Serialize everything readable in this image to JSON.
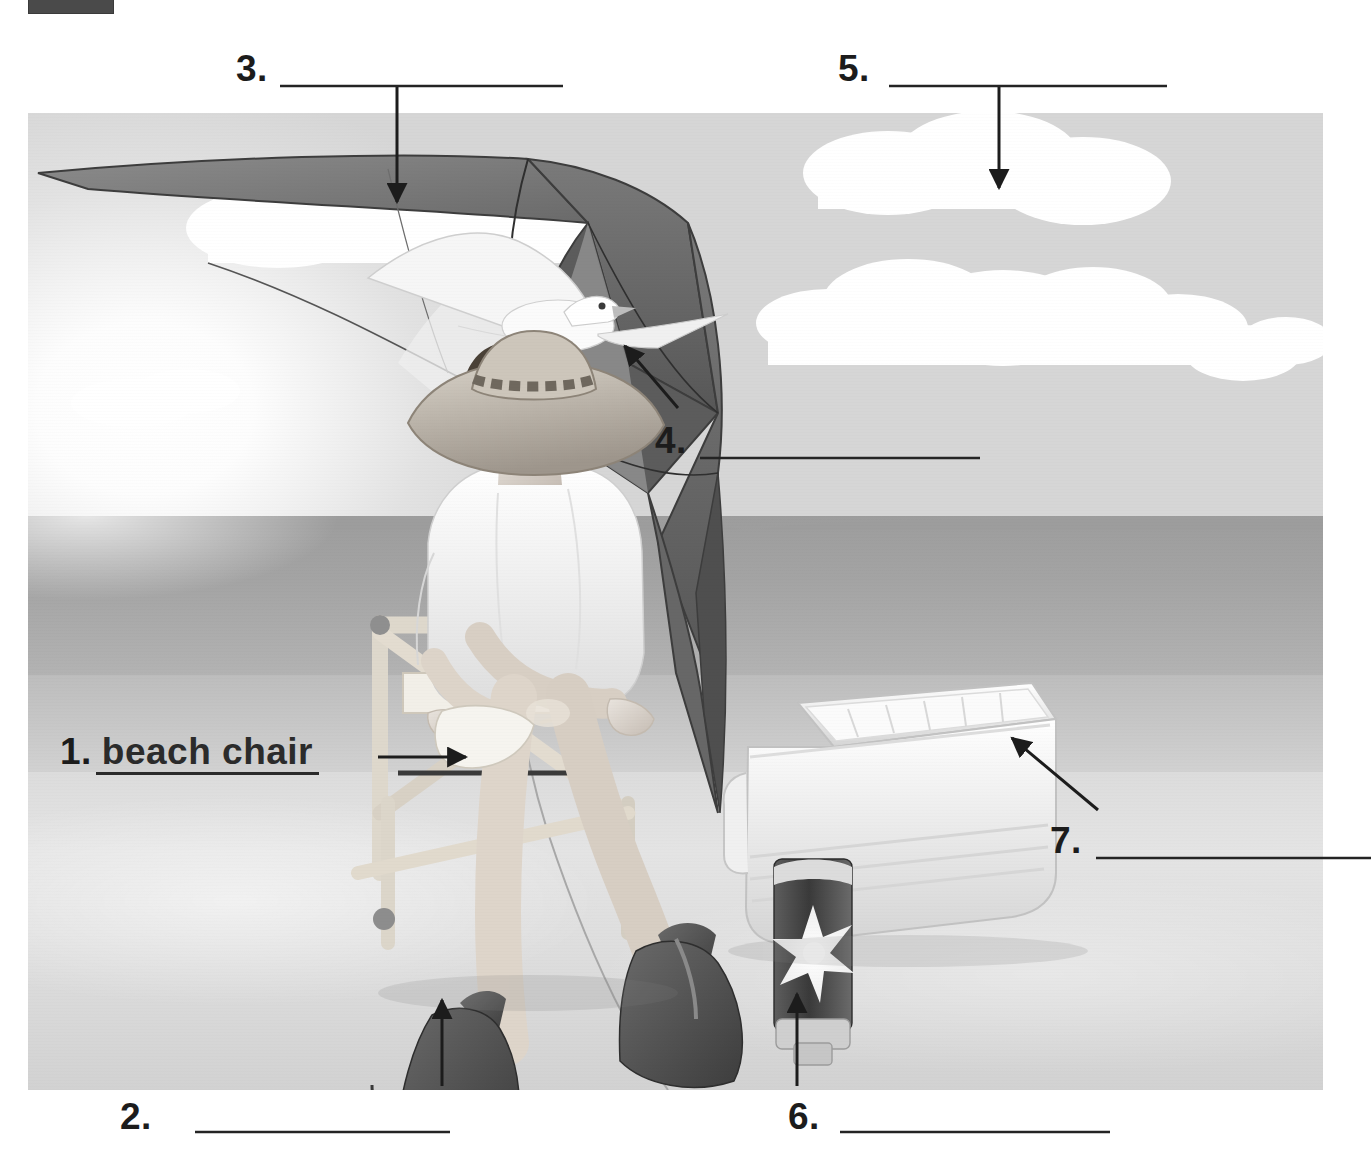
{
  "page": {
    "type": "vocabulary-labeling-worksheet",
    "scene_description": "beach scene illustration with numbered label blanks",
    "illustration_subjects": [
      "woman sitting in beach chair wearing sun hat",
      "seagull flying",
      "swim fins",
      "stunt kite",
      "sunscreen tube",
      "cooler"
    ]
  },
  "corner_tab": {
    "name": "page-corner-tab",
    "color": "#4a4a4a"
  },
  "labels": [
    {
      "number": "1.",
      "answer": "beach chair",
      "filled": true,
      "arrow": "right"
    },
    {
      "number": "2.",
      "answer": "",
      "filled": false,
      "arrow": "up"
    },
    {
      "number": "3.",
      "answer": "",
      "filled": false,
      "arrow": "down"
    },
    {
      "number": "4.",
      "answer": "",
      "filled": false,
      "arrow": "up-left"
    },
    {
      "number": "5.",
      "answer": "",
      "filled": false,
      "arrow": "down"
    },
    {
      "number": "6.",
      "answer": "",
      "filled": false,
      "arrow": "up"
    },
    {
      "number": "7.",
      "answer": "",
      "filled": false,
      "arrow": "up-left"
    }
  ],
  "colors": {
    "ink": "#1c1c1c",
    "sky": "#cfcfcf",
    "ocean": "#a2a2a2",
    "sand": "#e0e0e0",
    "kite_dark": "#6f6f6f",
    "fins": "#4b4b4b",
    "cooler": "#f2f2f2",
    "corner_tab": "#4a4a4a"
  }
}
